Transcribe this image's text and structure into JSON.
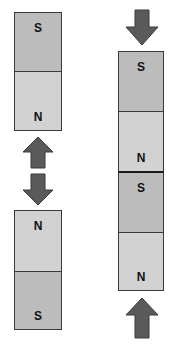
{
  "colors": {
    "south_pole": "#bcbcbc",
    "north_pole": "#d2d2d2",
    "arrow": "#5a5a5a",
    "outline": "#3a3a3a"
  },
  "left_group": {
    "magnet_top": {
      "upper_label": "S",
      "lower_label": "N"
    },
    "arrows": [
      {
        "direction": "up"
      },
      {
        "direction": "down"
      }
    ],
    "magnet_bottom": {
      "upper_label": "N",
      "lower_label": "S"
    }
  },
  "right_group": {
    "arrow_top": {
      "direction": "down"
    },
    "magnet_top": {
      "upper_label": "S",
      "lower_label": "N"
    },
    "magnet_bottom": {
      "upper_label": "S",
      "lower_label": "N"
    },
    "arrow_bottom": {
      "direction": "up"
    }
  }
}
